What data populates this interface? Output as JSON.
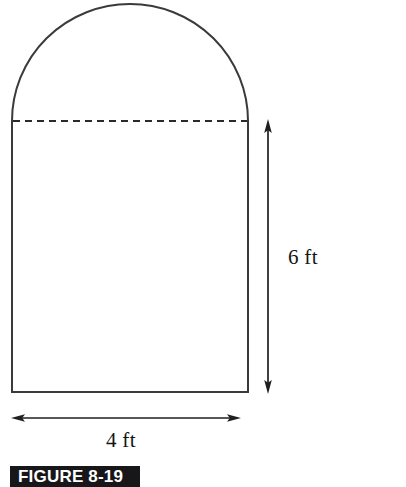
{
  "figure": {
    "caption": "FIGURE 8-19",
    "shape_name": "arched-prism-cross-section",
    "stroke_color": "#3a3a3a",
    "dashed_line_color": "#2a2a2a",
    "background_color": "#ffffff",
    "caption_background_color": "#17171a",
    "caption_text_color": "#ffffff"
  },
  "dimensions": {
    "height": {
      "label": "6 ft",
      "value": 6,
      "unit": "ft",
      "orientation": "vertical"
    },
    "width": {
      "label": "4 ft",
      "value": 4,
      "unit": "ft",
      "orientation": "horizontal"
    }
  },
  "geometry": {
    "rect_left_x": 12,
    "rect_right_x": 248,
    "rect_top_y": 121,
    "rect_bottom_y": 392,
    "arch_apex_y": 4,
    "arch_radius": 118,
    "dashed_line_y": 121,
    "vertical_dim_x": 268,
    "vertical_dim_top_y": 121,
    "vertical_dim_bottom_y": 392,
    "horizontal_dim_y": 418,
    "horizontal_dim_left_x": 12,
    "horizontal_dim_right_x": 240
  }
}
